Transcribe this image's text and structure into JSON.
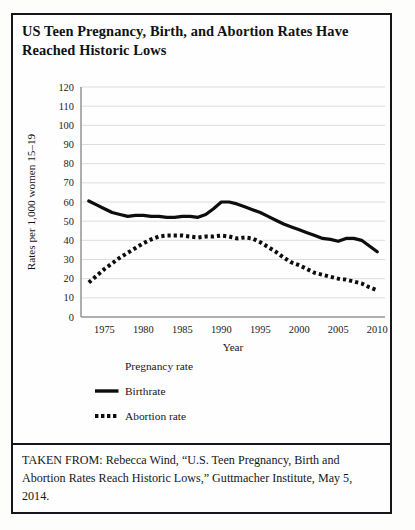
{
  "document": {
    "title": "US Teen Pregnancy, Birth, and Abortion Rates Have Reached Historic Lows",
    "caption": "TAKEN FROM: Rebecca Wind, “U.S. Teen Pregnancy, Birth and Abortion Rates Reach Historic Lows,” Guttmacher Institute, May 5, 2014."
  },
  "colors": {
    "ink": "#15161a",
    "series_line": "#0d0d0d",
    "gridline": "#d9d9d9",
    "axis": "#9a9a9a",
    "page": "#fdfdfc"
  },
  "chart_data": {
    "type": "line",
    "title": "US Teen Pregnancy, Birth, and Abortion Rates Have Reached Historic Lows",
    "xlabel": "Year",
    "ylabel": "Rates per 1,000 women 15–19",
    "xlim": [
      1972,
      2011
    ],
    "ylim": [
      0,
      120
    ],
    "yticks": [
      0,
      10,
      20,
      30,
      40,
      50,
      60,
      70,
      80,
      90,
      100,
      110,
      120
    ],
    "xticks": [
      1975,
      1980,
      1985,
      1990,
      1995,
      2000,
      2005,
      2010
    ],
    "grid": true,
    "legend_position": "below-plot-left",
    "series": [
      {
        "name": "Pregnancy rate",
        "style": "none",
        "x": [],
        "values": []
      },
      {
        "name": "Birthrate",
        "style": "solid",
        "x": [
          1973,
          1974,
          1975,
          1976,
          1977,
          1978,
          1979,
          1980,
          1981,
          1982,
          1983,
          1984,
          1985,
          1986,
          1987,
          1988,
          1989,
          1990,
          1991,
          1992,
          1993,
          1994,
          1995,
          1996,
          1997,
          1998,
          1999,
          2000,
          2001,
          2002,
          2003,
          2004,
          2005,
          2006,
          2007,
          2008,
          2009,
          2010
        ],
        "values": [
          60.5,
          58.5,
          56.5,
          54.5,
          53.5,
          52.5,
          53.0,
          53.0,
          52.5,
          52.5,
          52.0,
          52.0,
          52.5,
          52.5,
          52.0,
          53.5,
          56.5,
          60.0,
          60.0,
          59.0,
          57.5,
          56.0,
          54.5,
          52.5,
          50.5,
          48.5,
          47.0,
          45.5,
          44.0,
          42.5,
          41.0,
          40.5,
          39.5,
          41.0,
          41.0,
          40.0,
          37.0,
          34.0
        ]
      },
      {
        "name": "Abortion rate",
        "style": "dotted",
        "x": [
          1973,
          1974,
          1975,
          1976,
          1977,
          1978,
          1979,
          1980,
          1981,
          1982,
          1983,
          1984,
          1985,
          1986,
          1987,
          1988,
          1989,
          1990,
          1991,
          1992,
          1993,
          1994,
          1995,
          1996,
          1997,
          1998,
          1999,
          2000,
          2001,
          2002,
          2003,
          2004,
          2005,
          2006,
          2007,
          2008,
          2009,
          2010
        ],
        "values": [
          18.0,
          21.5,
          25.0,
          28.0,
          31.0,
          33.5,
          36.0,
          38.5,
          40.5,
          42.0,
          42.5,
          42.5,
          42.5,
          42.0,
          41.5,
          42.0,
          42.0,
          42.5,
          42.0,
          41.0,
          41.5,
          41.0,
          39.0,
          36.5,
          34.0,
          31.0,
          28.5,
          27.0,
          25.0,
          23.0,
          22.0,
          21.0,
          20.0,
          19.5,
          18.5,
          17.5,
          15.5,
          14.0
        ]
      }
    ],
    "legend": [
      {
        "label": "Pregnancy rate",
        "marker": "none"
      },
      {
        "label": "Birthrate",
        "marker": "solid-line"
      },
      {
        "label": "Abortion rate",
        "marker": "dotted-line"
      }
    ]
  }
}
